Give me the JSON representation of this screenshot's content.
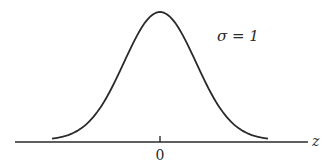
{
  "chart_data": {
    "type": "line",
    "title": "",
    "xlabel": "z",
    "ylabel": "",
    "annotation": "σ = 1",
    "x_ticks": [
      "0"
    ],
    "series": [
      {
        "name": "standard normal density",
        "mean": 0,
        "sigma": 1,
        "x": [
          -3,
          -2.5,
          -2,
          -1.5,
          -1,
          -0.5,
          0,
          0.5,
          1,
          1.5,
          2,
          2.5,
          3
        ],
        "values": [
          0.0044,
          0.0175,
          0.054,
          0.1295,
          0.242,
          0.3521,
          0.3989,
          0.3521,
          0.242,
          0.1295,
          0.054,
          0.0175,
          0.0044
        ]
      }
    ],
    "xlim": [
      -4,
      4
    ],
    "grid": false,
    "legend": "none"
  },
  "labels": {
    "sigma": "σ = 1",
    "axis": "z",
    "tick_zero": "0"
  },
  "colors": {
    "line": "#2a2a2a",
    "background": "#ffffff"
  }
}
